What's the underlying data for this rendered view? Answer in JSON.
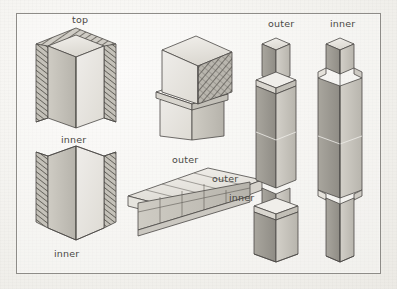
{
  "figure": {
    "medium": "pencil and ink isometric technical illustration",
    "background_color": "#f2f1ed",
    "frame_color": "#8e8c88",
    "ink_color": "#4a4845",
    "stone_light": "#e3e1db",
    "stone_mid": "#c9c6bf",
    "stone_dark": "#a5a29a",
    "hatch_color": "#6f6c66"
  },
  "labels": [
    {
      "id": "top-left-block-top",
      "text": "top",
      "x": 72,
      "y": 14
    },
    {
      "id": "top-left-block-inner",
      "text": "inner",
      "x": 61,
      "y": 134
    },
    {
      "id": "bottom-left-block-inner",
      "text": "inner",
      "x": 54,
      "y": 248
    },
    {
      "id": "slab-outer-upper",
      "text": "outer",
      "x": 172,
      "y": 154
    },
    {
      "id": "slab-outer-right",
      "text": "outer",
      "x": 212,
      "y": 173
    },
    {
      "id": "slab-inner-right",
      "text": "inner",
      "x": 229,
      "y": 192
    },
    {
      "id": "column-left-outer",
      "text": "outer",
      "x": 268,
      "y": 18
    },
    {
      "id": "column-right-inner",
      "text": "inner",
      "x": 330,
      "y": 18
    }
  ],
  "drawings": [
    {
      "id": "top-left-pier-block",
      "description": "isometric square pier block, upper portion, hatched outer faces with plain inner core, label top above"
    },
    {
      "id": "bottom-left-pier-block",
      "description": "isometric square pier block, lower portion, hatched side shells with open inner corner, label inner above and below"
    },
    {
      "id": "center-cap-block",
      "description": "isometric cap stone seated on a pier shaft, right face cross-hatched"
    },
    {
      "id": "center-slab-course",
      "description": "isometric slab course showing jointed top paving and coursed masonry face beneath, labelled outer and inner"
    },
    {
      "id": "column-outer",
      "description": "tall slender square column, outer variant, shown with stepped shaft sections and projecting base block"
    },
    {
      "id": "column-inner",
      "description": "tall slender square column, inner variant, shown with notched shaft shoulders top and bottom"
    }
  ]
}
